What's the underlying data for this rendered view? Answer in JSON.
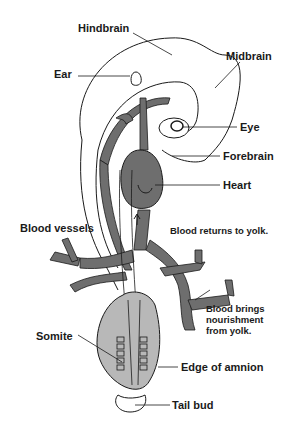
{
  "diagram": {
    "type": "anatomical-illustration",
    "colors": {
      "background": "#ffffff",
      "outline": "#1a1a1a",
      "vessel_fill": "#6e6e6e",
      "amnion_fill": "#b8b8b8",
      "label_text": "#1a1a1a"
    },
    "labels": {
      "hindbrain": "Hindbrain",
      "midbrain": "Midbrain",
      "ear": "Ear",
      "eye": "Eye",
      "forebrain": "Forebrain",
      "heart": "Heart",
      "blood_vessels": "Blood vessels",
      "blood_returns": "Blood returns to yolk.",
      "blood_brings_1": "Blood brings",
      "blood_brings_2": "nourishment",
      "blood_brings_3": "from yolk.",
      "somite": "Somite",
      "edge_of_amnion": "Edge of amnion",
      "tail_bud": "Tail bud"
    }
  }
}
